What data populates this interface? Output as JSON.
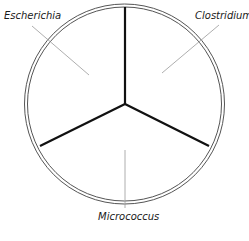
{
  "diagram": {
    "type": "petri-dish-sections",
    "dish": {
      "cx": 124.5,
      "cy": 104,
      "outer_r": 100,
      "inner_r": 97,
      "stroke": "#555555"
    },
    "divider": {
      "center": [
        125,
        104
      ],
      "color": "#111111",
      "ends": [
        [
          125,
          7
        ],
        [
          40,
          146
        ],
        [
          209,
          146
        ]
      ]
    },
    "sections": [
      {
        "label": "Escherichia",
        "label_pos": [
          4,
          10
        ],
        "leader": [
          [
            32,
            26
          ],
          [
            89,
            75
          ]
        ]
      },
      {
        "label": "Clostridium",
        "label_pos": [
          195,
          10
        ],
        "leader": [
          [
            219,
            25
          ],
          [
            162,
            73
          ]
        ]
      },
      {
        "label": "Micrococcus",
        "label_pos": [
          98,
          211
        ],
        "leader": [
          [
            125,
            150
          ],
          [
            125,
            208
          ]
        ]
      }
    ],
    "leader_color": "#999999"
  }
}
